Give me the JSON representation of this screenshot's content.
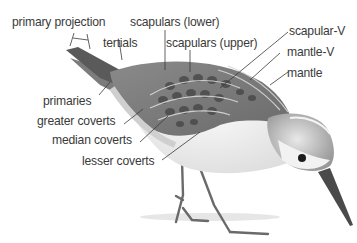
{
  "diagram": {
    "labels": [
      {
        "id": "primary-projection",
        "text": "primary projection"
      },
      {
        "id": "tertials",
        "text": "tertials"
      },
      {
        "id": "scapulars-lower",
        "text": "scapulars (lower)"
      },
      {
        "id": "scapulars-upper",
        "text": "scapulars (upper)"
      },
      {
        "id": "scapular-v",
        "text": "scapular-V"
      },
      {
        "id": "mantle-v",
        "text": "mantle-V"
      },
      {
        "id": "mantle",
        "text": "mantle"
      },
      {
        "id": "primaries",
        "text": "primaries"
      },
      {
        "id": "greater-coverts",
        "text": "greater coverts"
      },
      {
        "id": "median-coverts",
        "text": "median coverts"
      },
      {
        "id": "lesser-coverts",
        "text": "lesser coverts"
      }
    ]
  }
}
